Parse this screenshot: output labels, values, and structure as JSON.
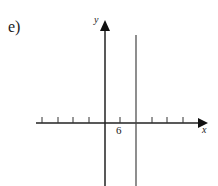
{
  "part_label": "e)",
  "axes": {
    "x_label": "x",
    "y_label": "y",
    "tick_label": "6",
    "tick_label_position": 1,
    "ticks_left_of_origin": 4,
    "ticks_right_of_origin": 5
  },
  "graph": {
    "description": "Vertical line x = 12 (two tick marks right of origin, each tick = 6)",
    "line_type": "vertical",
    "x_value": 12,
    "color": "#333333"
  }
}
